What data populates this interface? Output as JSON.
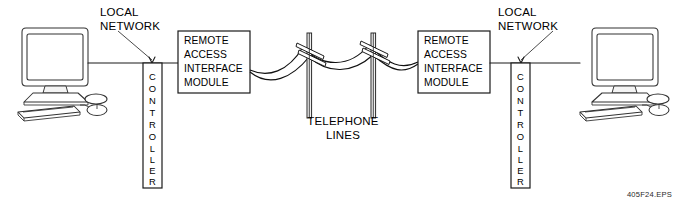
{
  "diagram": {
    "caption": "405F24.EPS",
    "labels": {
      "local_network_left_line1": "LOCAL",
      "local_network_left_line2": "NETWORK",
      "local_network_right_line1": "LOCAL",
      "local_network_right_line2": "NETWORK",
      "telephone_lines_line1": "TELEPHONE",
      "telephone_lines_line2": "LINES"
    },
    "left_module": {
      "line1": "REMOTE",
      "line2": "ACCESS",
      "line3": "INTERFACE",
      "line4": "MODULE"
    },
    "right_module": {
      "line1": "REMOTE",
      "line2": "ACCESS",
      "line3": "INTERFACE",
      "line4": "MODULE"
    },
    "left_controller": {
      "text": "CONTROLLER",
      "letters": [
        "C",
        "O",
        "N",
        "T",
        "R",
        "O",
        "L",
        "L",
        "E",
        "R"
      ]
    },
    "right_controller": {
      "text": "CONTROLLER",
      "letters": [
        "C",
        "O",
        "N",
        "T",
        "R",
        "O",
        "L",
        "L",
        "E",
        "R"
      ]
    },
    "nodes": {
      "left_computer": "computer-workstation",
      "right_computer": "computer-workstation",
      "pole_left": "telephone-pole",
      "pole_right": "telephone-pole"
    },
    "colors": {
      "line": "#1a1a1a",
      "fill": "#ffffff",
      "shade": "#f4f4f4",
      "background": "#ffffff"
    }
  }
}
